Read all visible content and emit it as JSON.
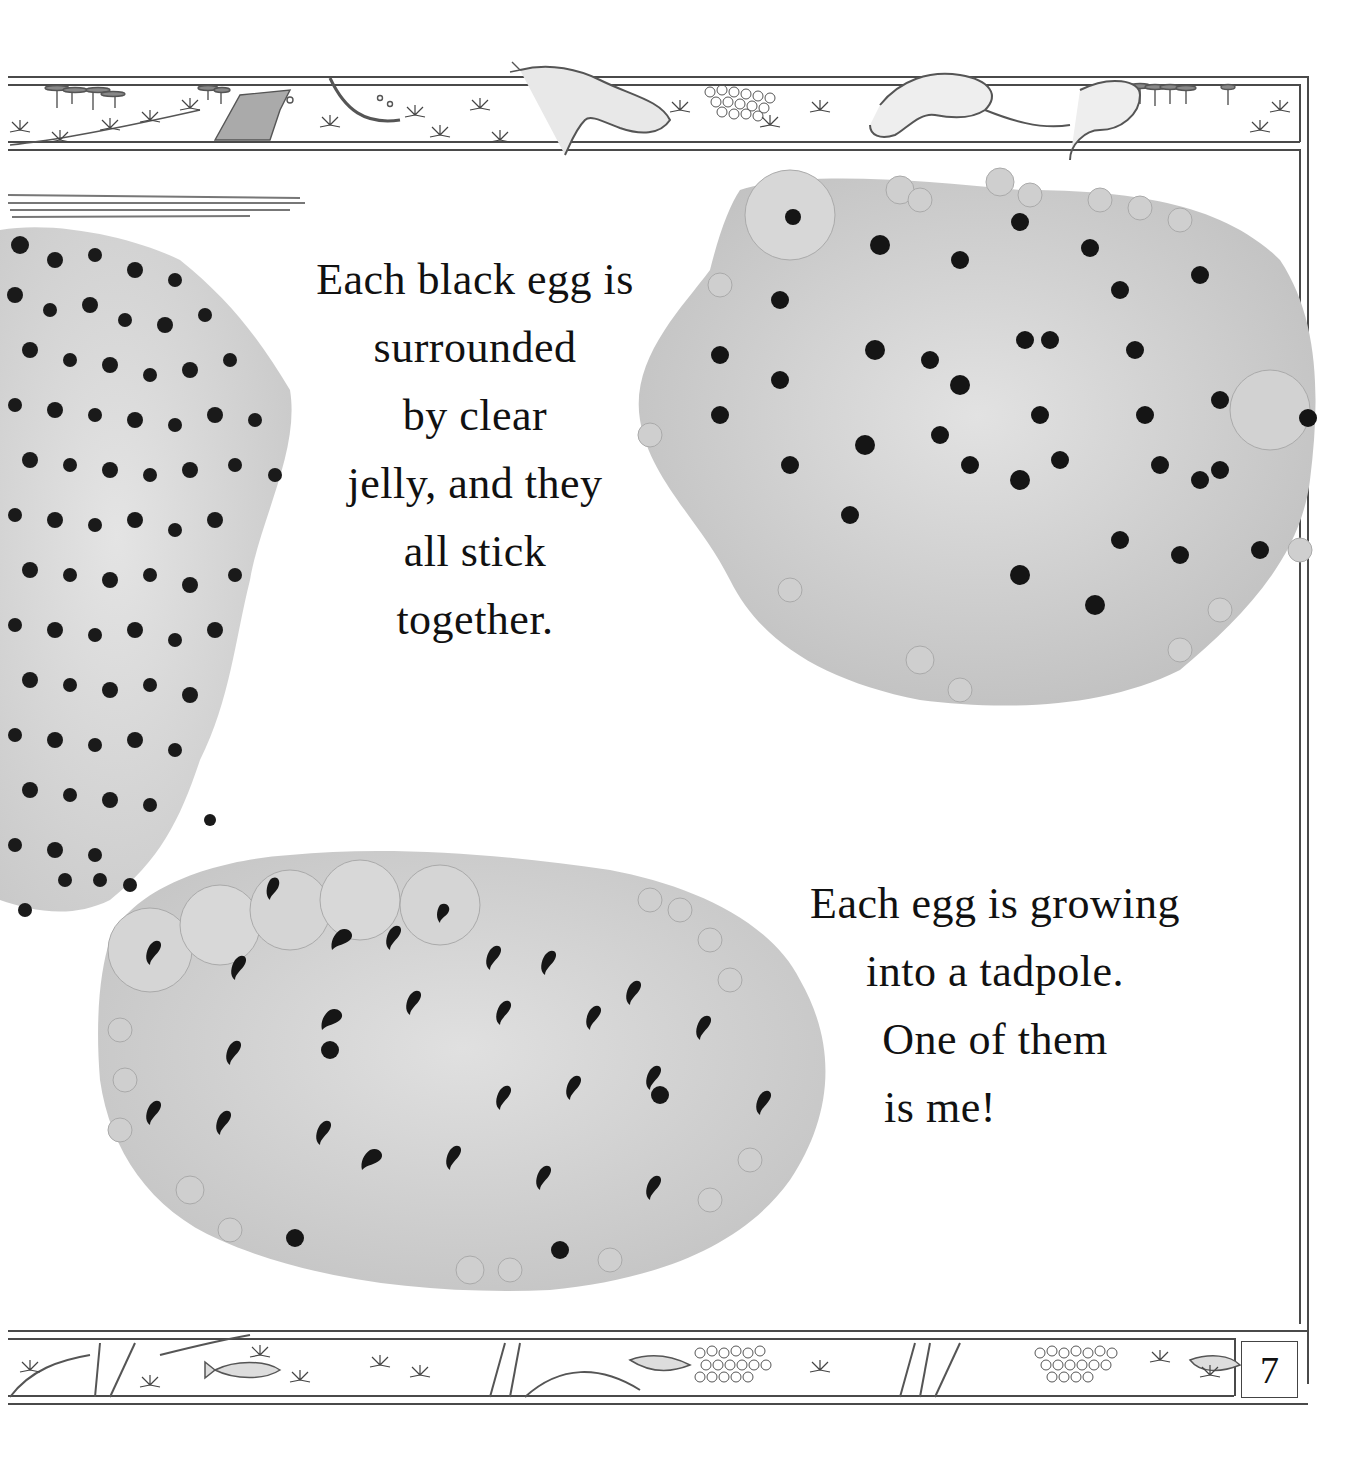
{
  "page": {
    "number": "7",
    "background": "#ffffff"
  },
  "captions": {
    "top": {
      "lines": [
        "Each black egg is",
        "surrounded",
        "by clear",
        "jelly, and they",
        "all stick",
        "together."
      ]
    },
    "bottom": {
      "lines": [
        "Each egg is growing",
        "into a tadpole.",
        "One of them",
        "is me!"
      ]
    }
  },
  "illustrations": {
    "top_border": [
      "lily-pads",
      "pondweed",
      "frog-foot",
      "frog-swimming",
      "frogspawn",
      "two-frogs"
    ],
    "bottom_border": [
      "reeds",
      "pondweed",
      "fish",
      "frogspawn",
      "fish"
    ],
    "photos": [
      "frogspawn-left-black-eggs",
      "frogspawn-top-right-round-eggs",
      "frogspawn-bottom-left-developing-tadpoles"
    ]
  },
  "colors": {
    "ink": "#111111",
    "border": "#4a4a4a",
    "jelly": "#d8d8d8",
    "egg": "#1a1a1a"
  }
}
